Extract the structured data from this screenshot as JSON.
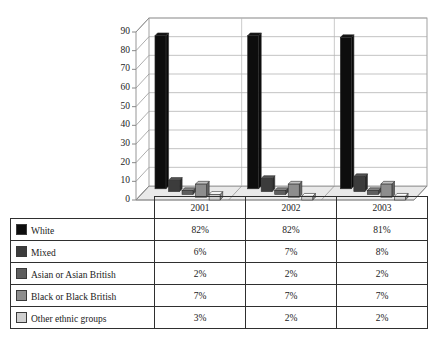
{
  "page": {
    "bleed_top": "",
    "bleed_bottom": ""
  },
  "chart": {
    "y_axis": {
      "ticks": [
        "90",
        "80",
        "70",
        "60",
        "50",
        "40",
        "30",
        "20",
        "10",
        "0"
      ],
      "min": 0,
      "max": 90
    },
    "x_axis": {
      "categories": [
        "2001",
        "2002",
        "2003"
      ]
    }
  },
  "table": {
    "year_headers": [
      "2001",
      "2002",
      "2003"
    ],
    "rows": [
      {
        "label": "White",
        "swatch": "#0d0d0d",
        "values": [
          "82%",
          "82%",
          "81%"
        ]
      },
      {
        "label": "Mixed",
        "swatch": "#3c3c3c",
        "values": [
          "6%",
          "7%",
          "8%"
        ]
      },
      {
        "label": "Asian or Asian British",
        "swatch": "#5e5e5e",
        "values": [
          "2%",
          "2%",
          "2%"
        ]
      },
      {
        "label": "Black or Black British",
        "swatch": "#8d8d8d",
        "values": [
          "7%",
          "7%",
          "7%"
        ]
      },
      {
        "label": "Other ethnic groups",
        "swatch": "#cfcfcf",
        "values": [
          "3%",
          "2%",
          "2%"
        ]
      }
    ]
  },
  "chart_data": {
    "type": "bar",
    "title": "",
    "subtitle": "",
    "xlabel": "",
    "ylabel": "",
    "ylim": [
      0,
      90
    ],
    "ytick_step": 10,
    "grid": true,
    "legend_position": "table-below",
    "three_d": true,
    "categories": [
      "2001",
      "2002",
      "2003"
    ],
    "series": [
      {
        "name": "White",
        "color": "#0d0d0d",
        "values": [
          82,
          82,
          81
        ]
      },
      {
        "name": "Mixed",
        "color": "#3c3c3c",
        "values": [
          6,
          7,
          8
        ]
      },
      {
        "name": "Asian or Asian British",
        "color": "#5e5e5e",
        "values": [
          2,
          2,
          2
        ]
      },
      {
        "name": "Black or Black British",
        "color": "#8d8d8d",
        "values": [
          7,
          7,
          7
        ]
      },
      {
        "name": "Other ethnic groups",
        "color": "#cfcfcf",
        "values": [
          3,
          2,
          2
        ]
      }
    ]
  }
}
